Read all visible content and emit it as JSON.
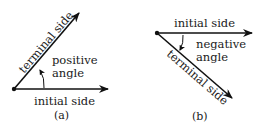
{
  "figure": {
    "panels": [
      {
        "id": "a",
        "caption": "(a)",
        "initial_side_label": "initial side",
        "terminal_side_label": "terminal side",
        "angle_label_line1": "positive",
        "angle_label_line2": "angle",
        "direction": "counterclockwise"
      },
      {
        "id": "b",
        "caption": "(b)",
        "initial_side_label": "initial side",
        "terminal_side_label": "terminal side",
        "angle_label_line1": "negative",
        "angle_label_line2": "angle",
        "direction": "clockwise"
      }
    ],
    "colors": {
      "background": "#ffffff",
      "ink": "#111111"
    }
  }
}
